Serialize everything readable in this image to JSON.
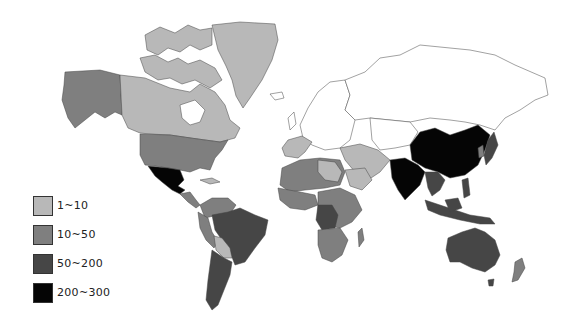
{
  "map": {
    "type": "choropleth world map",
    "colors": {
      "ocean": "#ffffff",
      "nodata": "#ffffff",
      "class_1": "#b8b8b8",
      "class_2": "#7f7f7f",
      "class_3": "#464646",
      "class_4": "#050505",
      "border": "#444444"
    }
  },
  "legend": {
    "items": [
      {
        "label": "1~10",
        "color": "#b8b8b8"
      },
      {
        "label": "10~50",
        "color": "#7f7f7f"
      },
      {
        "label": "50~200",
        "color": "#464646"
      },
      {
        "label": "200~300",
        "color": "#050505"
      }
    ]
  }
}
